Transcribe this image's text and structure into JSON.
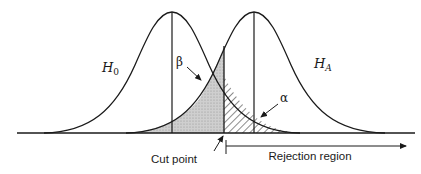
{
  "diagram": {
    "title": "",
    "curves": [
      {
        "id": "h0",
        "label": "H",
        "subscript": "0",
        "mean_x": 172
      },
      {
        "id": "ha",
        "label": "H",
        "subscript": "A",
        "mean_x": 254
      }
    ],
    "regions": {
      "beta": {
        "label": "β",
        "fill": "stippled gray"
      },
      "alpha": {
        "label": "α",
        "fill": "diagonal hatch"
      }
    },
    "annotations": {
      "cut_point": "Cut point",
      "rejection_region": "Rejection region"
    },
    "colors": {
      "line": "#1a1a1a",
      "beta_fill": "#c8c8c8",
      "background": "#ffffff"
    }
  }
}
